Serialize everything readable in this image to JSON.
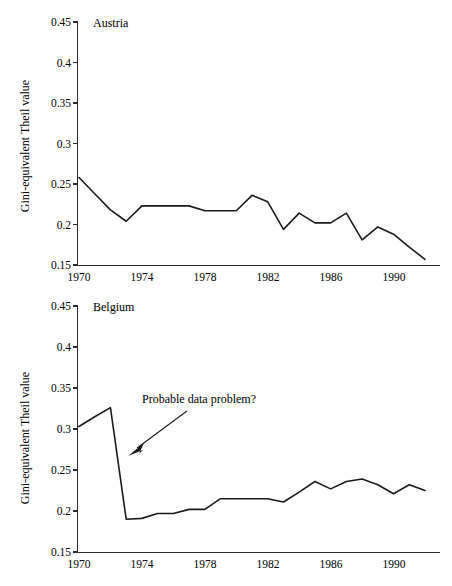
{
  "figure": {
    "background_color": "#ffffff",
    "line_color": "#1a1a1a",
    "axis_color": "#2a2a2a",
    "panel_count": 2
  },
  "axis": {
    "y_title": "Gini-equivalent Theil value",
    "y_ticks": [
      "0.45",
      "0.4",
      "0.35",
      "0.3",
      "0.25",
      "0.2",
      "0.15"
    ],
    "x_ticks": [
      "1970",
      "1974",
      "1978",
      "1982",
      "1986",
      "1990"
    ]
  },
  "panels": [
    {
      "id": "austria",
      "title": "Austria",
      "has_annotation": false
    },
    {
      "id": "belgium",
      "title": "Belgium",
      "has_annotation": true,
      "annotation": {
        "text": "Probable data problem?",
        "target_year": 1973,
        "target_value": 0.255
      }
    }
  ],
  "chart_data": [
    {
      "type": "line",
      "title": "Austria",
      "xlabel": "",
      "ylabel": "Gini-equivalent Theil value",
      "xlim": [
        1970,
        1992
      ],
      "ylim": [
        0.15,
        0.45
      ],
      "xticks": [
        1970,
        1974,
        1978,
        1982,
        1986,
        1990
      ],
      "yticks": [
        0.15,
        0.2,
        0.25,
        0.3,
        0.35,
        0.4,
        0.45
      ],
      "grid": false,
      "legend": "none",
      "x": [
        1970,
        1971,
        1972,
        1973,
        1974,
        1975,
        1976,
        1977,
        1978,
        1979,
        1980,
        1981,
        1982,
        1983,
        1984,
        1985,
        1986,
        1987,
        1988,
        1989,
        1990,
        1991,
        1992
      ],
      "series": [
        {
          "name": "Austria",
          "values": [
            0.258,
            0.238,
            0.218,
            0.204,
            0.223,
            0.223,
            0.223,
            0.223,
            0.217,
            0.217,
            0.217,
            0.236,
            0.228,
            0.194,
            0.214,
            0.202,
            0.202,
            0.214,
            0.181,
            0.197,
            0.188,
            0.172,
            0.157
          ]
        }
      ]
    },
    {
      "type": "line",
      "title": "Belgium",
      "xlabel": "",
      "ylabel": "Gini-equivalent Theil value",
      "xlim": [
        1970,
        1992
      ],
      "ylim": [
        0.15,
        0.45
      ],
      "xticks": [
        1970,
        1974,
        1978,
        1982,
        1986,
        1990
      ],
      "yticks": [
        0.15,
        0.2,
        0.25,
        0.3,
        0.35,
        0.4,
        0.45
      ],
      "grid": false,
      "legend": "none",
      "annotations": [
        {
          "text": "Probable data problem?",
          "x": 1973,
          "y": 0.255
        }
      ],
      "x": [
        1970,
        1971,
        1972,
        1973,
        1974,
        1975,
        1976,
        1977,
        1978,
        1979,
        1980,
        1981,
        1982,
        1983,
        1984,
        1985,
        1986,
        1987,
        1988,
        1989,
        1990,
        1991,
        1992
      ],
      "series": [
        {
          "name": "Belgium",
          "values": [
            0.303,
            0.315,
            0.326,
            0.19,
            0.191,
            0.197,
            0.197,
            0.202,
            0.202,
            0.215,
            0.215,
            0.215,
            0.215,
            0.211,
            0.223,
            0.236,
            0.227,
            0.236,
            0.239,
            0.232,
            0.221,
            0.232,
            0.225
          ]
        }
      ]
    }
  ]
}
